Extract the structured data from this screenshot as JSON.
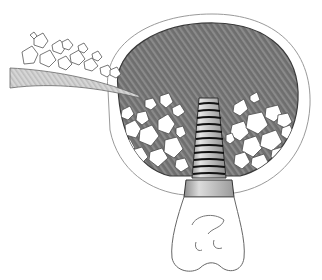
{
  "figure": {
    "title": "",
    "colors": {
      "background": "#ffffff",
      "sinus_fill": "#6e6e6e",
      "sinus_stripe": "#8a8a8a",
      "outline": "#3a3a3a",
      "bone_outline": "#8c8c8c",
      "graft_fill": "#ffffff",
      "implant_fill": "#c8c8c8",
      "implant_thread": "#111111",
      "collar_fill": "#b4b4b4",
      "instrument_fill": "#cfcfcf"
    },
    "parts": [
      {
        "name": "instrument",
        "label": ""
      },
      {
        "name": "sinus-cavity",
        "label": ""
      },
      {
        "name": "bone-graft-particles",
        "label": ""
      },
      {
        "name": "implant",
        "label": "",
        "thread_count": 11
      },
      {
        "name": "abutment-collar",
        "label": ""
      },
      {
        "name": "crown",
        "label": ""
      }
    ]
  }
}
